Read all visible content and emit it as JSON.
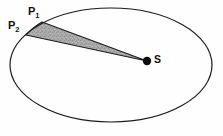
{
  "figure": {
    "type": "diagram",
    "background_color": "#fefefe",
    "width": 223,
    "height": 136
  },
  "ellipse": {
    "name": "orbit-ellipse",
    "center_x": 111,
    "center_y": 65,
    "radius_x": 101,
    "radius_y": 57,
    "stroke_color": "#1b1b1b",
    "stroke_width": 1.2,
    "fill": "none"
  },
  "sector": {
    "name": "swept-area-sector",
    "fill_color": "#a6a6a6",
    "stroke_color": "#1b1b1b",
    "stroke_width": 1.1,
    "description": "shaded area swept between P1, P2 and focus S"
  },
  "points": [
    {
      "id": "p1",
      "label": "P",
      "subscript": "1",
      "x": 42,
      "y": 22,
      "marker": "none"
    },
    {
      "id": "p2",
      "label": "P",
      "subscript": "2",
      "x": 26,
      "y": 35,
      "marker": "none"
    },
    {
      "id": "s",
      "label": "S",
      "subscript": "",
      "x": 147,
      "y": 61,
      "marker": "filled-dot",
      "marker_radius": 4.2,
      "marker_color": "#0d0d0d"
    }
  ],
  "labels": {
    "p1_text": "P",
    "p1_sub": "1",
    "p2_text": "P",
    "p2_sub": "2",
    "s_text": "S"
  }
}
